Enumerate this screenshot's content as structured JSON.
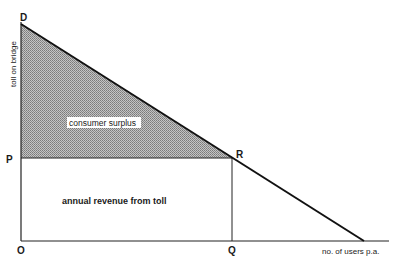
{
  "diagram": {
    "axes": {
      "y_label": "toll on bridge",
      "x_label": "no. of users p.a."
    },
    "points": {
      "D": "D",
      "P": "P",
      "R": "R",
      "O": "O",
      "Q": "Q"
    },
    "regions": {
      "consumer_surplus": "consumer surplus",
      "annual_revenue": "annual revenue from toll"
    },
    "colors": {
      "line": "#111111",
      "hatch_fill": "#9a9a9a",
      "background": "#ffffff"
    }
  }
}
